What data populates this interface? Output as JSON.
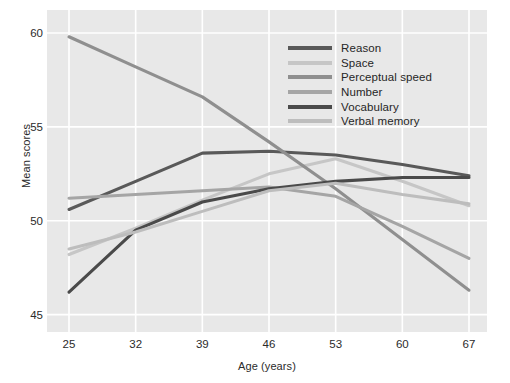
{
  "chart_data": {
    "type": "line",
    "title": "",
    "xlabel": "Age (years)",
    "ylabel": "Mean scores",
    "x": [
      25,
      32,
      39,
      46,
      53,
      60,
      67
    ],
    "xtick_labels": [
      "25",
      "32",
      "39",
      "46",
      "53",
      "60",
      "67"
    ],
    "ytick_labels": [
      "45",
      "50",
      "55",
      "60"
    ],
    "yticks": [
      45,
      50,
      55,
      60
    ],
    "xlim": [
      25,
      67
    ],
    "ylim": [
      44.5,
      60.8
    ],
    "grid": true,
    "legend_position": "upper-right-inside",
    "series": [
      {
        "name": "Reason",
        "color": "#595959",
        "values": [
          50.6,
          52.1,
          53.6,
          53.7,
          53.5,
          53.0,
          52.4
        ]
      },
      {
        "name": "Space",
        "color": "#c6c6c6",
        "values": [
          48.2,
          49.6,
          51.1,
          52.5,
          53.3,
          52.1,
          50.8
        ]
      },
      {
        "name": "Perceptual speed",
        "color": "#8f8f8f",
        "values": [
          59.8,
          58.2,
          56.6,
          54.2,
          51.7,
          49.0,
          46.3
        ]
      },
      {
        "name": "Number",
        "color": "#a5a5a5",
        "values": [
          51.2,
          51.4,
          51.6,
          51.8,
          51.3,
          49.7,
          48.0
        ]
      },
      {
        "name": "Vocabulary",
        "color": "#4a4a4a",
        "values": [
          46.2,
          49.5,
          51.0,
          51.7,
          52.1,
          52.3,
          52.3
        ]
      },
      {
        "name": "Verbal memory",
        "color": "#bdbdbd",
        "values": [
          48.5,
          49.4,
          50.5,
          51.6,
          52.0,
          51.4,
          50.9
        ]
      }
    ]
  },
  "legend": {
    "items": [
      {
        "label": "Reason"
      },
      {
        "label": "Space"
      },
      {
        "label": "Perceptual speed"
      },
      {
        "label": "Number"
      },
      {
        "label": "Vocabulary"
      },
      {
        "label": "Verbal memory"
      }
    ]
  },
  "colors": {
    "panel_background": "#e8e8e8",
    "figure_background": "#ffffff",
    "gridline": "#ffffff",
    "text": "#2b2b2b"
  }
}
